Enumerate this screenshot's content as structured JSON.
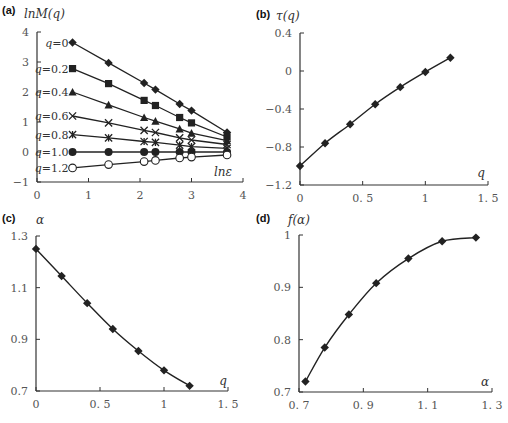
{
  "chart_data": [
    {
      "panel": "(a)",
      "type": "line",
      "title": "",
      "xlabel": "lnε",
      "ylabel": "lnM(q)",
      "xlim": [
        0,
        4
      ],
      "ylim": [
        -1,
        4
      ],
      "xticks": [
        "0",
        "1",
        "2",
        "3",
        "4"
      ],
      "yticks": [
        "-1",
        "0",
        "1",
        "2",
        "3",
        "4"
      ],
      "grid": false,
      "x": [
        0.69,
        1.39,
        2.08,
        2.3,
        2.77,
        3.0,
        3.69
      ],
      "series": [
        {
          "name": "q=0",
          "marker": "diamond",
          "values": [
            3.65,
            2.97,
            2.3,
            2.08,
            1.6,
            1.38,
            0.65
          ]
        },
        {
          "name": "q=0.2",
          "marker": "square",
          "values": [
            2.78,
            2.28,
            1.72,
            1.55,
            1.15,
            0.97,
            0.5
          ]
        },
        {
          "name": "q=0.4",
          "marker": "triangle",
          "values": [
            2.0,
            1.57,
            1.15,
            1.03,
            0.77,
            0.63,
            0.38
          ]
        },
        {
          "name": "q=0.6",
          "marker": "x",
          "values": [
            1.2,
            0.97,
            0.72,
            0.65,
            0.47,
            0.4,
            0.25
          ]
        },
        {
          "name": "q=0.8",
          "marker": "star",
          "values": [
            0.58,
            0.47,
            0.35,
            0.32,
            0.23,
            0.18,
            0.12
          ]
        },
        {
          "name": "q=1.0",
          "marker": "circle-filled",
          "values": [
            0,
            0,
            0,
            0,
            0,
            0,
            0
          ]
        },
        {
          "name": "q=1.2",
          "marker": "circle-open",
          "values": [
            -0.53,
            -0.42,
            -0.32,
            -0.28,
            -0.2,
            -0.17,
            -0.1
          ]
        }
      ]
    },
    {
      "panel": "(b)",
      "type": "line",
      "xlabel": "q",
      "ylabel": "τ(q)",
      "xlim": [
        0,
        1.5
      ],
      "ylim": [
        -1.2,
        0.4
      ],
      "xticks": [
        "0",
        "0.5",
        "1",
        "1.5"
      ],
      "yticks": [
        "-1.2",
        "-0.8",
        "-0.4",
        "0",
        "0.4"
      ],
      "grid": false,
      "x": [
        0,
        0.2,
        0.4,
        0.6,
        0.8,
        1.0,
        1.2
      ],
      "values": [
        -1.0,
        -0.76,
        -0.56,
        -0.35,
        -0.17,
        -0.01,
        0.14
      ]
    },
    {
      "panel": "(c)",
      "type": "line",
      "xlabel": "q",
      "ylabel": "α",
      "xlim": [
        0,
        1.5
      ],
      "ylim": [
        0.7,
        1.3
      ],
      "xticks": [
        "0",
        "0.5",
        "1",
        "1.5"
      ],
      "yticks": [
        "0.7",
        "0.9",
        "1.1",
        "1.3"
      ],
      "grid": false,
      "x": [
        0,
        0.2,
        0.4,
        0.6,
        0.8,
        1.0,
        1.2
      ],
      "values": [
        1.25,
        1.145,
        1.04,
        0.94,
        0.855,
        0.78,
        0.72
      ]
    },
    {
      "panel": "(d)",
      "type": "line",
      "xlabel": "α",
      "ylabel": "f(α)",
      "xlim": [
        0.7,
        1.3
      ],
      "ylim": [
        0.7,
        1.0
      ],
      "xticks": [
        "0.7",
        "0.9",
        "1.1",
        "1.3"
      ],
      "yticks": [
        "0.7",
        "0.8",
        "0.9",
        "1"
      ],
      "grid": false,
      "x": [
        0.72,
        0.78,
        0.855,
        0.94,
        1.04,
        1.145,
        1.25
      ],
      "values": [
        0.72,
        0.785,
        0.848,
        0.908,
        0.955,
        0.988,
        0.995
      ]
    }
  ],
  "labels": {
    "a": {
      "panel": "(a)",
      "ylabel": "lnM(q)",
      "xlabel": "lnε"
    },
    "b": {
      "panel": "(b)",
      "ylabel": "τ(q)",
      "xlabel": "q"
    },
    "c": {
      "panel": "(c)",
      "ylabel": "α",
      "xlabel": "q"
    },
    "d": {
      "panel": "(d)",
      "ylabel": "f(α)",
      "xlabel": "α"
    }
  }
}
